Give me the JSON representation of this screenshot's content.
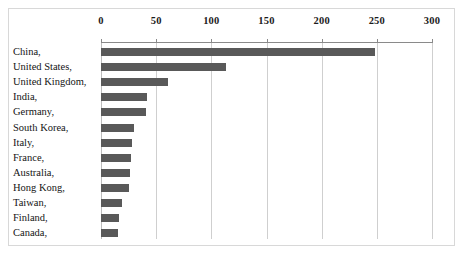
{
  "chart_data": {
    "type": "bar",
    "orientation": "horizontal",
    "title": "",
    "xlabel": "",
    "ylabel": "",
    "xlim": [
      0,
      300
    ],
    "xticks": [
      0,
      50,
      100,
      150,
      200,
      250,
      300
    ],
    "grid": true,
    "legend": false,
    "bar_color": "#595959",
    "categories": [
      "China,",
      "United States,",
      "United Kingdom,",
      "India,",
      "Germany,",
      "South Korea,",
      "Italy,",
      "France,",
      "Australia,",
      "Hong Kong,",
      "Taiwan,",
      "Finland,",
      "Canada,"
    ],
    "values": [
      248,
      113,
      61,
      42,
      41,
      30,
      28,
      27,
      26,
      25,
      19,
      16,
      15
    ]
  }
}
